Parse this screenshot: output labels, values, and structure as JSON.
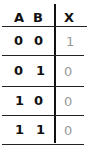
{
  "table": {
    "headers": {
      "a": "A",
      "b": "B",
      "x": "X"
    },
    "rows": [
      {
        "a": "0",
        "b": "0",
        "x": "1"
      },
      {
        "a": "0",
        "b": "1",
        "x": "0"
      },
      {
        "a": "1",
        "b": "0",
        "x": "0"
      },
      {
        "a": "1",
        "b": "1",
        "x": "0"
      }
    ]
  },
  "colors": {
    "ink": "#111111",
    "output_ink": "#999999",
    "background": "#ffffff"
  }
}
